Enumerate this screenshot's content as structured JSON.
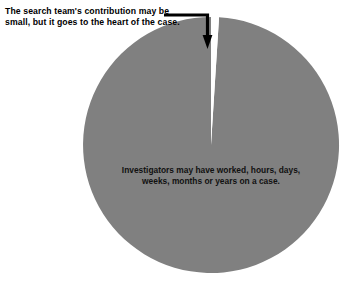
{
  "figure": {
    "background_color": "#ffffff",
    "annotation": {
      "text": "The search team's contribution may be\nsmall, but it goes to the heart of the case.",
      "color": "#000000",
      "leader_line": {
        "icon": "elbow-arrow-down-icon",
        "color": "#000000"
      }
    }
  },
  "chart_data": {
    "type": "pie",
    "title": "",
    "subtitle": "",
    "xlabel": "",
    "ylabel": "",
    "legend_position": "none",
    "grid": false,
    "start_angle_deg": 90,
    "direction": "clockwise",
    "categories": [
      "Search team contribution",
      "Investigator time on a case"
    ],
    "values": [
      1,
      99
    ],
    "units": "percent",
    "colors": [
      "#ffffff",
      "#808080"
    ],
    "edge_color": "#808080",
    "annotations": [
      {
        "target_slice": "Search team contribution",
        "text": "The search team's contribution may be\nsmall, but it goes to the heart of the case."
      },
      {
        "target_slice": "Investigator time on a case",
        "text": "Investigators may have worked, hours, days,\nweeks, months or years on a case."
      }
    ],
    "slice_labels": [
      "",
      "Investigators may have worked, hours, days,\nweeks, months or years on a case."
    ]
  },
  "geometry": {
    "center_x": 211,
    "center_y": 145,
    "radius": 128,
    "thin_slice_angle_deg": 3.2
  }
}
